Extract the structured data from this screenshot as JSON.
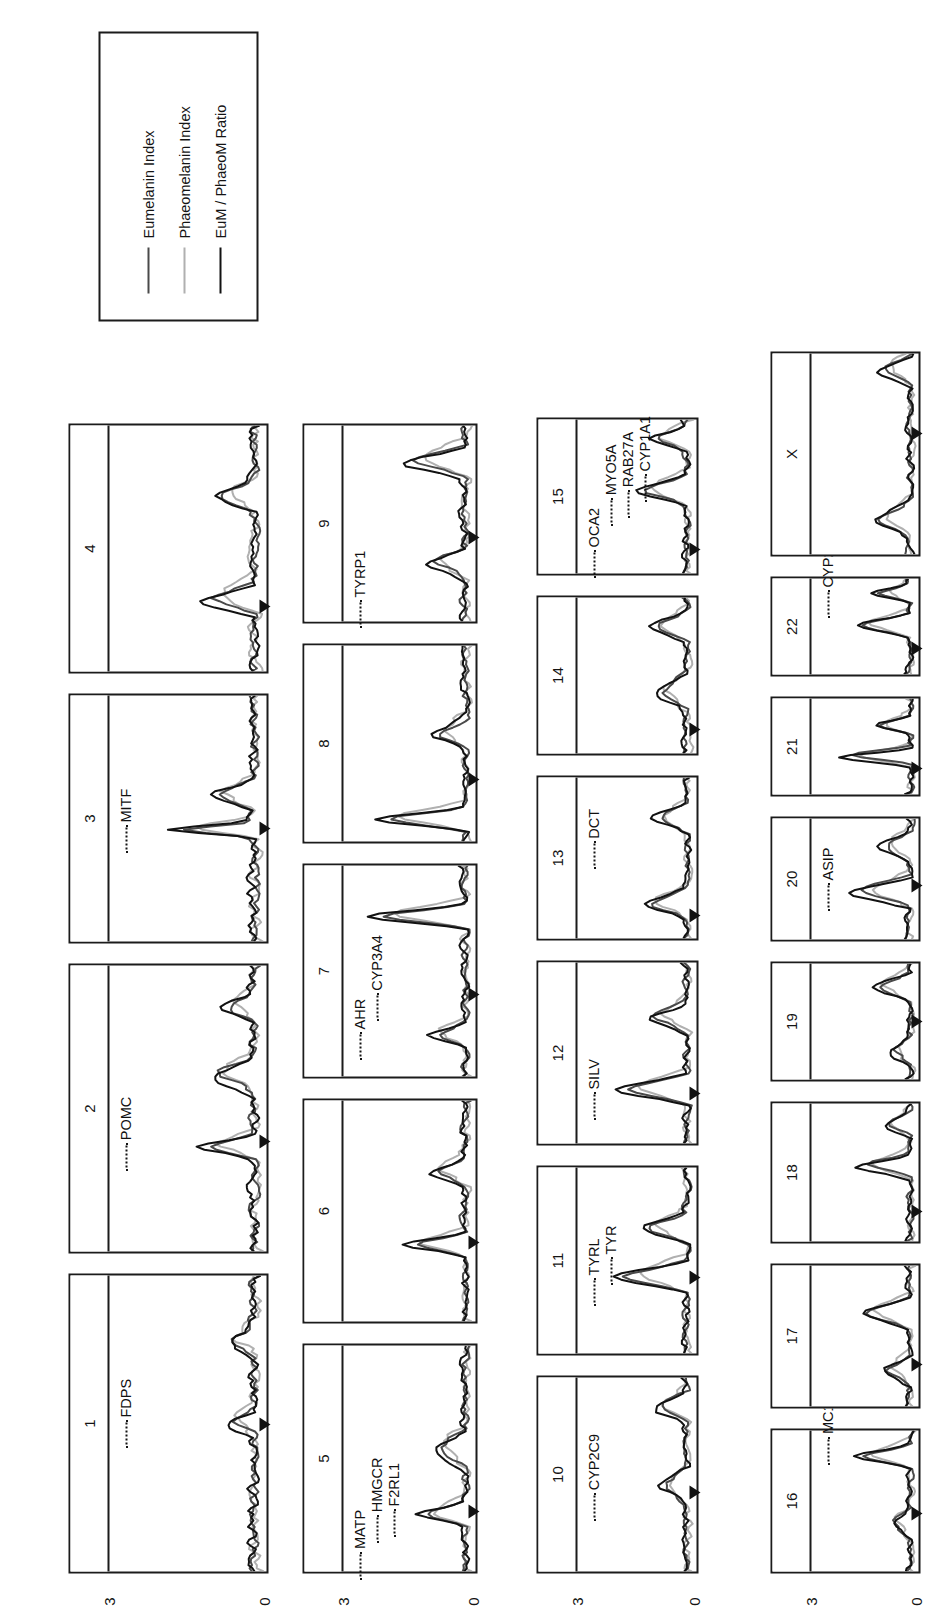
{
  "figure": {
    "orientation_deg": -90,
    "background": "#ffffff",
    "axis_tick_labels": [
      "3",
      "0"
    ],
    "y_axis_max": 3,
    "y_axis_min": 0
  },
  "legend": {
    "items": [
      {
        "label": "Eumelanin Index",
        "color": "#4a4a4a"
      },
      {
        "label": "Phaeomelanin Index",
        "color": "#b0b0b0"
      },
      {
        "label": "EuM / PhaeoM Ratio",
        "color": "#121212"
      }
    ]
  },
  "chart_data": {
    "type": "line",
    "title": "",
    "xlabel": "",
    "ylabel": "",
    "ylim": [
      0,
      3
    ],
    "grid": false,
    "legend_position": "right",
    "series_names": [
      "Eumelanin Index",
      "Phaeomelanin Index",
      "EuM / PhaeoM Ratio"
    ],
    "series_colors": [
      "#4a4a4a",
      "#b0b0b0",
      "#121212"
    ],
    "panels": [
      {
        "id": "1",
        "label": "1",
        "genes": [
          "FDPS"
        ]
      },
      {
        "id": "2",
        "label": "2",
        "genes": [
          "POMC"
        ]
      },
      {
        "id": "3",
        "label": "3",
        "genes": [
          "MITF"
        ]
      },
      {
        "id": "4",
        "label": "4",
        "genes": []
      },
      {
        "id": "5",
        "label": "5",
        "genes": [
          "MATP",
          "HMGCR",
          "F2RL1"
        ]
      },
      {
        "id": "6",
        "label": "6",
        "genes": []
      },
      {
        "id": "7",
        "label": "7",
        "genes": [
          "AHR",
          "CYP3A4"
        ]
      },
      {
        "id": "8",
        "label": "8",
        "genes": []
      },
      {
        "id": "9",
        "label": "9",
        "genes": [
          "TYRP1"
        ]
      },
      {
        "id": "10",
        "label": "10",
        "genes": [
          "CYP2C9"
        ]
      },
      {
        "id": "11",
        "label": "11",
        "genes": [
          "TYRL",
          "TYR"
        ]
      },
      {
        "id": "12",
        "label": "12",
        "genes": [
          "SILV"
        ]
      },
      {
        "id": "13",
        "label": "13",
        "genes": [
          "DCT"
        ]
      },
      {
        "id": "14",
        "label": "14",
        "genes": []
      },
      {
        "id": "15",
        "label": "15",
        "genes": [
          "OCA2",
          "MYO5A",
          "RAB27A",
          "CYP1A1"
        ]
      },
      {
        "id": "16",
        "label": "16",
        "genes": [
          "MC1R"
        ]
      },
      {
        "id": "17",
        "label": "17",
        "genes": []
      },
      {
        "id": "18",
        "label": "18",
        "genes": []
      },
      {
        "id": "19",
        "label": "19",
        "genes": []
      },
      {
        "id": "20",
        "label": "20",
        "genes": [
          "ASIP"
        ]
      },
      {
        "id": "21",
        "label": "21",
        "genes": []
      },
      {
        "id": "22",
        "label": "22",
        "genes": [
          "CYP2D6"
        ]
      },
      {
        "id": "X",
        "label": "X",
        "genes": []
      }
    ]
  }
}
